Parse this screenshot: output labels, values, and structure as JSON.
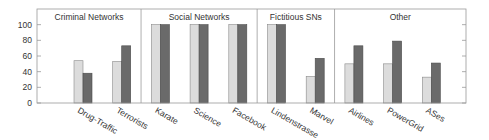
{
  "chart_data": {
    "type": "bar",
    "title": "",
    "xlabel": "",
    "ylabel": "",
    "ylim": [
      0,
      120
    ],
    "yticks": [
      0,
      20,
      40,
      60,
      80,
      100
    ],
    "grid": false,
    "legend": null,
    "categories": [
      "Drug-Traffic",
      "Terrorists",
      "Karate",
      "Science",
      "Facebook",
      "Lindenstrasse",
      "Marvel",
      "Airlines",
      "PowerGrid",
      "ASes"
    ],
    "groups": [
      {
        "label": "Criminal Networks",
        "categories": [
          "Drug-Traffic",
          "Terrorists"
        ]
      },
      {
        "label": "Social Networks",
        "categories": [
          "Karate",
          "Science",
          "Facebook"
        ]
      },
      {
        "label": "Fictitious SNs",
        "categories": [
          "Lindenstrasse",
          "Marvel"
        ]
      },
      {
        "label": "Other",
        "categories": [
          "Airlines",
          "PowerGrid",
          "ASes"
        ]
      }
    ],
    "series": [
      {
        "name": "series-light",
        "color": "#dcdcdc",
        "values": [
          54,
          53,
          100,
          100,
          100,
          100,
          34,
          50,
          50,
          33
        ]
      },
      {
        "name": "series-dark",
        "color": "#6a6a6a",
        "values": [
          38,
          73,
          100,
          100,
          100,
          100,
          57,
          73,
          79,
          51
        ]
      }
    ]
  },
  "colors": {
    "frame": "#999999",
    "light_bar": "#dcdcdc",
    "light_border": "#8a8a8a",
    "dark_bar": "#6a6a6a",
    "dark_border": "#4a4a4a",
    "text": "#333333"
  }
}
